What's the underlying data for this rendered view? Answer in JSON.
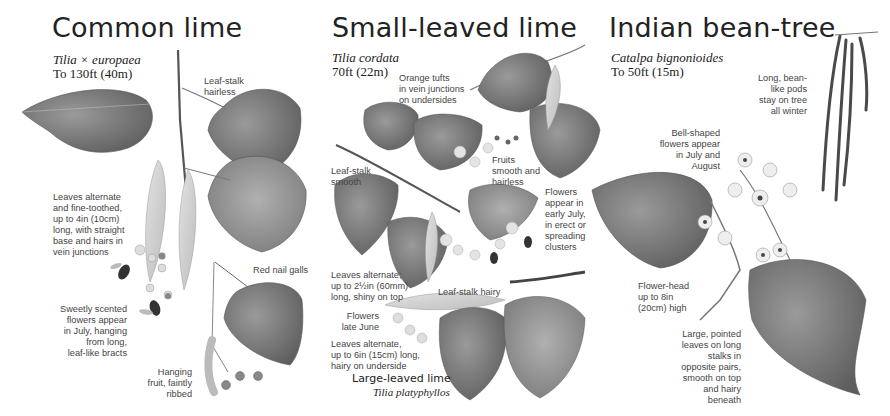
{
  "panels": [
    {
      "title": "Common lime",
      "latin": "Tilia × europaea",
      "height": "To 130ft (40m)",
      "notes": [
        "Leaf-stalk\nhairless",
        "Leaves alternate\nand fine-toothed,\nup to 4in (10cm)\nlong, with straight\nbase and hairs in\nvein junctions",
        "Red nail galls",
        "Sweetly scented\nflowers appear\nin July, hanging\nfrom long,\nleaf-like bracts",
        "Hanging\nfruit, faintly\nribbed"
      ]
    },
    {
      "title": "Small-leaved lime",
      "latin": "Tilia cordata",
      "height": "70ft (22m)",
      "notes": [
        "Orange tufts\nin vein junctions\non undersides",
        "Leaf-stalk\nsmooth",
        "Fruits\nsmooth and\nhairless",
        "Flowers\nappear in\nearly July,\nin erect or\nspreading\nclusters",
        "Leaves alternate;\nup to 2½in (60mm)\nlong, shiny on top",
        "Leaf-stalk hairy",
        "Flowers\nlate June",
        "Leaves alternate,\nup to 6in (15cm) long,\nhairy on underside"
      ],
      "subspecies": {
        "title": "Large-leaved lime",
        "latin": "Tilia platyphyllos"
      }
    },
    {
      "title": "Indian bean-tree",
      "latin": "Catalpa bignonioides",
      "height": "To 50ft (15m)",
      "notes": [
        "Long, bean-\nlike pods\nstay on tree\nall winter",
        "Bell-shaped\nflowers appear\nin July and\nAugust",
        "Flower-head\nup to 8in\n(20cm) high",
        "Large, pointed\nleaves on long\nstalks in\nopposite pairs,\nsmooth on top\nand hairy\nbeneath"
      ]
    }
  ],
  "colors": {
    "leaf_dark": "#6e6e6e",
    "leaf_mid": "#8c8c8c",
    "leaf_light": "#a8a8a8",
    "stem": "#5a5a5a",
    "bract": "#cfcfcf",
    "text": "#444444"
  }
}
